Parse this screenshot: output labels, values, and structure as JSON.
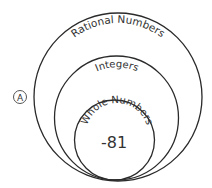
{
  "option_label": "A",
  "diagram": {
    "type": "nested-venn",
    "circles": [
      {
        "label": "Rational Numbers"
      },
      {
        "label": "Integers"
      },
      {
        "label": "Whole Numbers"
      }
    ],
    "value": "-81"
  },
  "colors": {
    "stroke": "#2a2a2a",
    "text": "#333333",
    "background": "#ffffff"
  }
}
